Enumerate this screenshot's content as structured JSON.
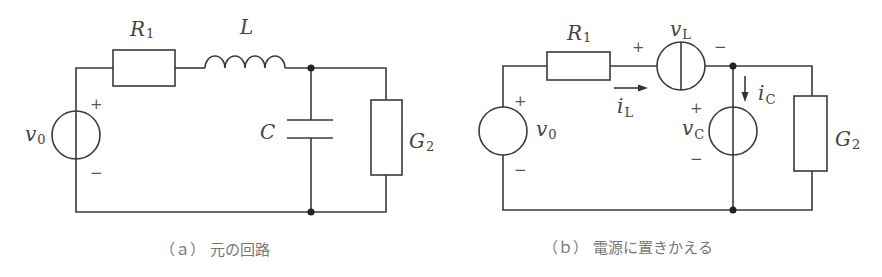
{
  "figure_a": {
    "caption": "（ａ） 元の回路",
    "labels": {
      "R1": "R",
      "R1_sub": "1",
      "L": "L",
      "C": "C",
      "G2": "G",
      "G2_sub": "2",
      "v0": "v",
      "v0_sub": "0"
    },
    "signs": {
      "plus": "+",
      "minus": "−"
    }
  },
  "figure_b": {
    "caption": "（ｂ） 電源に置きかえる",
    "labels": {
      "R1": "R",
      "R1_sub": "1",
      "vL": "v",
      "vL_sub": "L",
      "iL": "i",
      "iL_sub": "L",
      "vC": "v",
      "vC_sub": "C",
      "iC": "i",
      "iC_sub": "C",
      "G2": "G",
      "G2_sub": "2",
      "v0": "v",
      "v0_sub": "0"
    },
    "signs": {
      "plus": "+",
      "minus": "−"
    }
  }
}
